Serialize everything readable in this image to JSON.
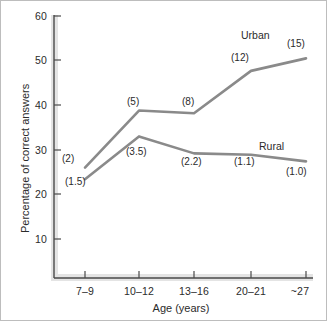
{
  "chart_data": {
    "type": "line",
    "title": "",
    "xlabel": "Age (years)",
    "ylabel": "Percentage of correct answers",
    "categories": [
      "7–9",
      "10–12",
      "13–16",
      "20–21",
      "~27"
    ],
    "ylim": [
      0,
      60
    ],
    "yticks": [
      10,
      20,
      30,
      40,
      50,
      60
    ],
    "ytick_labels": [
      "10",
      "20",
      "30",
      "40",
      "50",
      "60"
    ],
    "grid": false,
    "legend_position": "inline-end-of-line",
    "line_color": "#8a8a8a",
    "series": [
      {
        "name": "Urban",
        "values": [
          26.0,
          38.8,
          38.2,
          47.7,
          50.5
        ],
        "annotations": [
          "(2)",
          "(5)",
          "(8)",
          "(12)",
          "(15)"
        ]
      },
      {
        "name": "Rural",
        "values": [
          23.4,
          33.0,
          29.2,
          28.9,
          27.4
        ],
        "annotations": [
          "(1.5)",
          "(3.5)",
          "(2.2)",
          "(1.1)",
          "(1.0)"
        ]
      }
    ]
  },
  "axes": {
    "y_tick_labels": [
      "60",
      "50",
      "40",
      "30",
      "20",
      "10"
    ],
    "x_tick_labels": [
      "7–9",
      "10–12",
      "13–16",
      "20–21",
      "~27"
    ],
    "x_title": "Age (years)",
    "y_title": "Percentage of correct answers"
  },
  "series_labels": {
    "urban": "Urban",
    "rural": "Rural"
  },
  "annotations": {
    "urban": [
      "(2)",
      "(5)",
      "(8)",
      "(12)",
      "(15)"
    ],
    "rural": [
      "(1.5)",
      "(3.5)",
      "(2.2)",
      "(1.1)",
      "(1.0)"
    ]
  },
  "colors": {
    "line": "#8a8a8a",
    "axis": "#4a4a4a",
    "axis_shadow": "#d9d9d9",
    "text": "#2b2b2b",
    "frame": "#bdbdbd",
    "background": "#ffffff"
  }
}
